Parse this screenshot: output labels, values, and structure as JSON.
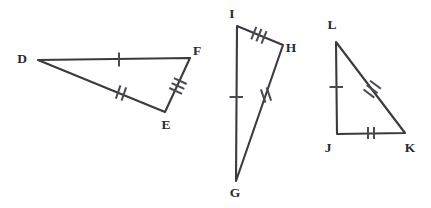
{
  "figure": {
    "background_color": "#ffffff",
    "stroke_color": "#3a3a42",
    "tick_color": "#4a4a52",
    "label_color": "#2b2b33",
    "width": 431,
    "height": 208
  },
  "triangles": [
    {
      "name": "triangle-def",
      "vertices": [
        {
          "label": "D",
          "x": 38,
          "y": 60,
          "label_x": 22,
          "label_y": 63
        },
        {
          "label": "F",
          "x": 190,
          "y": 58,
          "label_x": 197,
          "label_y": 55
        },
        {
          "label": "E",
          "x": 165,
          "y": 112,
          "label_x": 166,
          "label_y": 129
        }
      ],
      "sides": [
        {
          "name": "side-df",
          "from": "D",
          "to": "F",
          "ticks": 1,
          "tick_x": 119,
          "tick_y": 59
        },
        {
          "name": "side-fe",
          "from": "F",
          "to": "E",
          "ticks": 3,
          "tick_x": 178,
          "tick_y": 86
        },
        {
          "name": "side-de",
          "from": "D",
          "to": "E",
          "ticks": 2,
          "tick_x": 121,
          "tick_y": 93
        }
      ]
    },
    {
      "name": "triangle-ghi",
      "vertices": [
        {
          "label": "I",
          "x": 237,
          "y": 26,
          "label_x": 232,
          "label_y": 18
        },
        {
          "label": "H",
          "x": 283,
          "y": 45,
          "label_x": 291,
          "label_y": 52
        },
        {
          "label": "G",
          "x": 236,
          "y": 181,
          "label_x": 235,
          "label_y": 197
        }
      ],
      "sides": [
        {
          "name": "side-ih",
          "from": "I",
          "to": "H",
          "ticks": 3,
          "tick_x": 259,
          "tick_y": 35
        },
        {
          "name": "side-hg",
          "from": "H",
          "to": "G",
          "ticks": 2,
          "tick_x": 266,
          "tick_y": 95
        },
        {
          "name": "side-ig",
          "from": "I",
          "to": "G",
          "ticks": 1,
          "tick_x": 236,
          "tick_y": 97
        }
      ]
    },
    {
      "name": "triangle-jkl",
      "vertices": [
        {
          "label": "L",
          "x": 336,
          "y": 42,
          "label_x": 332,
          "label_y": 29
        },
        {
          "label": "J",
          "x": 337,
          "y": 134,
          "label_x": 328,
          "label_y": 152
        },
        {
          "label": "K",
          "x": 405,
          "y": 133,
          "label_x": 410,
          "label_y": 152
        }
      ],
      "sides": [
        {
          "name": "side-lj",
          "from": "L",
          "to": "J",
          "ticks": 1,
          "tick_x": 336,
          "tick_y": 87
        },
        {
          "name": "side-jk",
          "from": "J",
          "to": "K",
          "ticks": 2,
          "tick_x": 371,
          "tick_y": 133
        },
        {
          "name": "side-lk",
          "from": "L",
          "to": "K",
          "ticks": 3,
          "tick_x": 372,
          "tick_y": 89
        }
      ]
    }
  ]
}
